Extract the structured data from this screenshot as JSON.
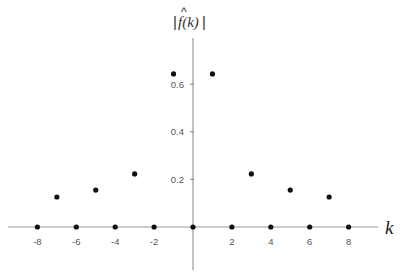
{
  "chart_data": {
    "type": "scatter",
    "title": "",
    "xlabel": "k",
    "ylabel": "|f̂(k)|",
    "ylabel_parts": {
      "bar_left": "|",
      "body": "f(k)",
      "hat": "^",
      "bar_right": "|"
    },
    "x": [
      -8,
      -7,
      -6,
      -5,
      -4,
      -3,
      -2,
      -1,
      0,
      1,
      2,
      3,
      4,
      5,
      6,
      7,
      8
    ],
    "y": [
      0,
      0.126,
      0,
      0.155,
      0,
      0.223,
      0,
      0.643,
      0,
      0.643,
      0,
      0.223,
      0,
      0.155,
      0,
      0.126,
      0
    ],
    "xticks": [
      -8,
      -6,
      -4,
      -2,
      2,
      4,
      6,
      8
    ],
    "xtick_labels": [
      "-8",
      "-6",
      "-4",
      "-2",
      "2",
      "4",
      "6",
      "8"
    ],
    "yticks": [
      0.2,
      0.4,
      0.6
    ],
    "ytick_labels": [
      "0.2",
      "0.4",
      "0.6"
    ],
    "xlim": [
      -9.5,
      9.5
    ],
    "ylim": [
      -0.18,
      0.79
    ],
    "grid": false,
    "legend": null
  },
  "colors": {
    "axis": "#9a9a9a",
    "dot": "#111111",
    "tick_label": "#555555"
  }
}
